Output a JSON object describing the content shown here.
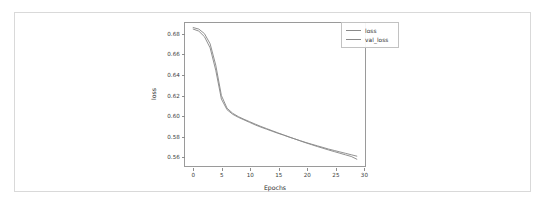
{
  "figure": {
    "background": "#ffffff",
    "frame_color": "#d9d9d9",
    "axis_color": "#9a9a9a"
  },
  "chart_data": {
    "type": "line",
    "title": "",
    "xlabel": "Epochs",
    "ylabel": "loss",
    "xlim": [
      -1.45,
      30.45
    ],
    "ylim": [
      0.5495,
      0.6905
    ],
    "xticks": [
      0,
      5,
      10,
      15,
      20,
      25,
      30
    ],
    "xtick_labels": [
      "0",
      "5",
      "10",
      "15",
      "20",
      "25",
      "30"
    ],
    "yticks": [
      0.56,
      0.58,
      0.6,
      0.62,
      0.64,
      0.66,
      0.68
    ],
    "ytick_labels": [
      "0.56",
      "0.58",
      "0.60",
      "0.62",
      "0.64",
      "0.66",
      "0.68"
    ],
    "grid": false,
    "legend_position": "upper right",
    "x": [
      0,
      1,
      2,
      3,
      4,
      5,
      6,
      7,
      8,
      9,
      10,
      11,
      12,
      13,
      14,
      15,
      16,
      17,
      18,
      19,
      20,
      21,
      22,
      23,
      24,
      25,
      26,
      27,
      28,
      29
    ],
    "series": [
      {
        "name": "loss",
        "color": "#8a8a8a",
        "values": [
          0.6845,
          0.6825,
          0.677,
          0.666,
          0.644,
          0.6155,
          0.605,
          0.6005,
          0.5975,
          0.595,
          0.5925,
          0.59,
          0.5878,
          0.5858,
          0.5838,
          0.5818,
          0.58,
          0.578,
          0.5762,
          0.5744,
          0.5726,
          0.571,
          0.5694,
          0.5678,
          0.5662,
          0.5648,
          0.5634,
          0.562,
          0.5606,
          0.5592
        ]
      },
      {
        "name": "val_loss",
        "color": "#8a8a8a",
        "values": [
          0.686,
          0.6845,
          0.68,
          0.67,
          0.649,
          0.619,
          0.6065,
          0.6015,
          0.5982,
          0.5956,
          0.5932,
          0.5908,
          0.5885,
          0.5864,
          0.5843,
          0.5822,
          0.5802,
          0.5782,
          0.5762,
          0.5742,
          0.5723,
          0.5705,
          0.5687,
          0.567,
          0.5653,
          0.5637,
          0.5621,
          0.5605,
          0.5589,
          0.5562
        ]
      }
    ]
  },
  "legend": {
    "entries": [
      {
        "label": "loss"
      },
      {
        "label": "val_loss"
      }
    ]
  }
}
